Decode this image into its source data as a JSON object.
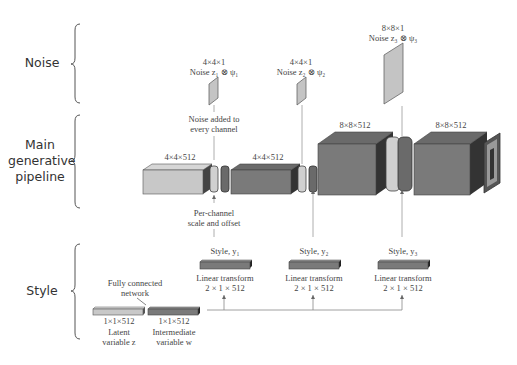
{
  "sections": {
    "noise": "Noise",
    "main_line1": "Main",
    "main_line2": "generative",
    "main_line3": "pipeline",
    "style": "Style"
  },
  "noise": [
    {
      "dims": "4×4×1",
      "label": "Noise z₁ ⊗ ψ₁"
    },
    {
      "dims": "4×4×1",
      "label": "Noise z₂ ⊗ ψ₂"
    },
    {
      "dims": "8×8×1",
      "label": "Noise z₃ ⊗ ψ₃"
    }
  ],
  "annotations": {
    "noise_added_1": "Noise added to",
    "noise_added_2": "every channel",
    "per_channel_1": "Per-channel",
    "per_channel_2": "scale and offset",
    "fc_1": "Fully connected",
    "fc_2": "network"
  },
  "pipeline": [
    {
      "dims": "4×4×512"
    },
    {
      "dims": "4×4×512"
    },
    {
      "dims": "8×8×512"
    },
    {
      "dims": "8×8×512"
    }
  ],
  "styles": [
    {
      "label": "Style, y₁",
      "transform": "Linear transform",
      "dims": "2 × 1 × 512"
    },
    {
      "label": "Style, y₂",
      "transform": "Linear transform",
      "dims": "2 × 1 × 512"
    },
    {
      "label": "Style, y₃",
      "transform": "Linear transform",
      "dims": "2 × 1 × 512"
    }
  ],
  "latent": {
    "dims": "1×1×512",
    "label1": "Latent",
    "label2": "variable z"
  },
  "intermediate": {
    "dims": "1×1×512",
    "label1": "Intermediate",
    "label2": "variable w"
  },
  "colors": {
    "light_block": "#c8c8c8",
    "dark_block": "#7a7a7a",
    "noise_panel": "#c4c4c4",
    "line": "#888888"
  }
}
